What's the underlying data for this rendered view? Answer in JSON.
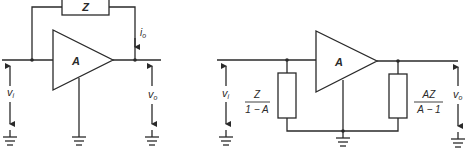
{
  "figure": {
    "left_circuit": {
      "feedback_impedance": "Z",
      "amplifier_gain": "A",
      "input_voltage": "v",
      "input_voltage_sub": "i",
      "output_voltage": "v",
      "output_voltage_sub": "o",
      "output_current": "i",
      "output_current_sub": "o"
    },
    "right_circuit": {
      "amplifier_gain": "A",
      "input_impedance_num": "Z",
      "input_impedance_den": "1 − A",
      "output_impedance_num": "AZ",
      "output_impedance_den": "A − 1",
      "input_voltage": "v",
      "input_voltage_sub": "i",
      "output_voltage": "v",
      "output_voltage_sub": "o"
    }
  }
}
